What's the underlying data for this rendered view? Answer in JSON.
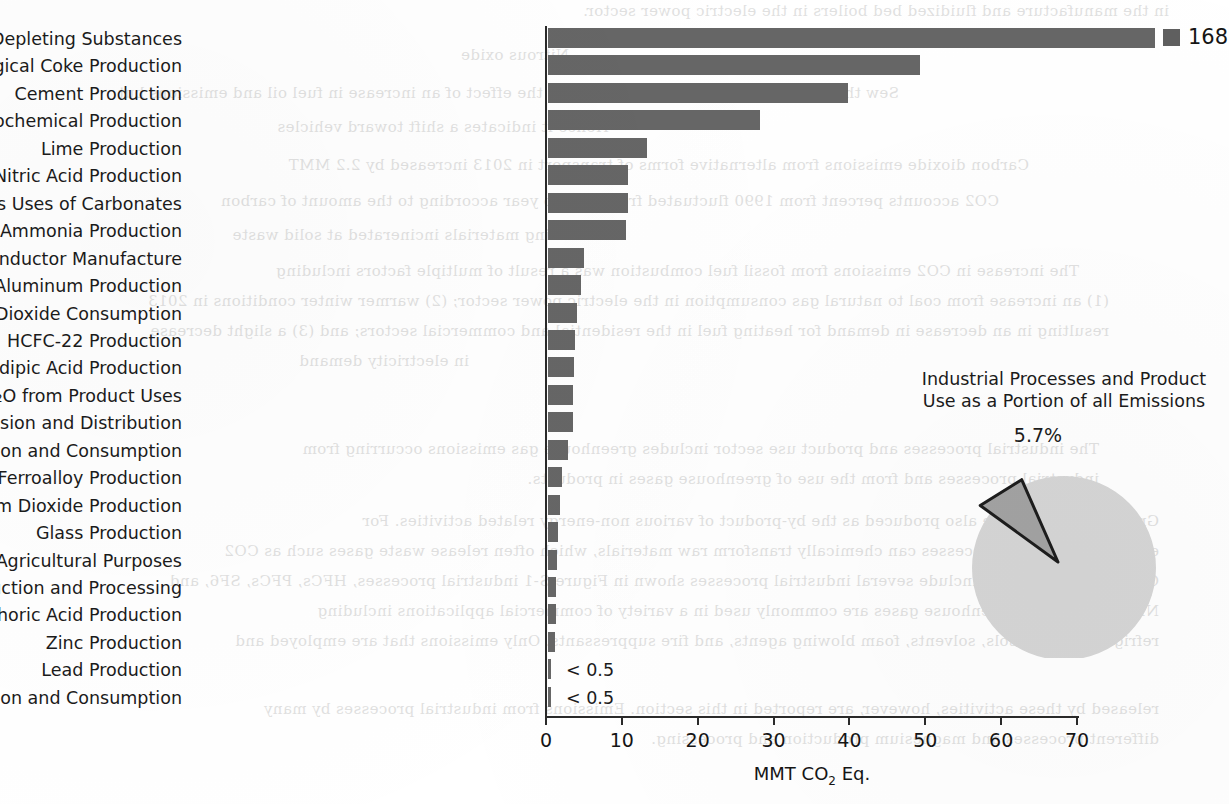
{
  "chart_data": {
    "type": "bar",
    "title": "",
    "xlabel": "MMT CO₂ Eq.",
    "ylabel": "",
    "xlim": [
      0,
      72
    ],
    "grid": false,
    "legend": "none",
    "orientation": "horizontal",
    "categories": [
      "Substitution of Ozone Depleting Substances",
      "Iron and Steel Production & Metallurgical Coke Production",
      "Cement Production",
      "Petrochemical Production",
      "Lime Production",
      "Nitric Acid Production",
      "Other Process Uses of Carbonates",
      "Ammonia Production",
      "Semiconductor Manufacture",
      "Aluminum Production",
      "Carbon Dioxide Consumption",
      "HCFC-22 Production",
      "Adipic Acid Production",
      "N₂O from Product Uses",
      "Electrical Transmission and Distribution",
      "Soda Ash Production and Consumption",
      "Ferroalloy Production",
      "Titanium Dioxide Production",
      "Glass Production",
      "Urea Consumption for Non-Agricultural Purposes",
      "Magnesium Production and Processing",
      "Phosphoric Acid Production",
      "Zinc Production",
      "Lead Production",
      "Silicon Carbide Production and Consumption"
    ],
    "values": [
      168,
      49.0,
      39.5,
      28.0,
      13.0,
      10.5,
      10.5,
      10.3,
      4.8,
      4.3,
      3.8,
      3.5,
      3.4,
      3.3,
      3.3,
      2.6,
      1.8,
      1.6,
      1.3,
      1.2,
      1.1,
      1.0,
      0.9,
      0.4,
      0.3
    ],
    "tick_values": [
      0,
      10,
      20,
      30,
      40,
      50,
      60,
      70
    ],
    "tick_labels": [
      "0",
      "10",
      "20",
      "30",
      "40",
      "50",
      "60",
      "70"
    ],
    "truncated_bar": {
      "category": "Substitution of Ozone Depleting Substances",
      "value": 168,
      "value_label": "168"
    },
    "bar_notes": [
      {
        "category": "Lead Production",
        "label": "< 0.5"
      },
      {
        "category": "Silicon Carbide Production and Consumption",
        "label": "< 0.5"
      }
    ],
    "bar_color": "#666666",
    "axis_color": "#2a2a2a"
  },
  "pie_chart": {
    "type": "pie",
    "title": "Industrial Processes and Product Use as a Portion of all Emissions",
    "title_line_1": "Industrial Processes and Product",
    "title_line_2": "Use as a Portion of all Emissions",
    "slices": [
      {
        "label": "Industrial Processes and Product Use",
        "value": 5.7,
        "value_label": "5.7%",
        "color": "#a3a3a3",
        "exploded": true
      },
      {
        "label": "All other emissions",
        "value": 94.3,
        "value_label": "",
        "color": "#d6d6d6",
        "exploded": false
      }
    ],
    "callout_label": "5.7%"
  },
  "background_bleed": {
    "note": "faint mirrored show-through text from reverse of scanned page",
    "lines": [
      "in the manufacture and fluidized bed boilers in the electric power sector.",
      "Nitrous oxide",
      "Sew through 2013 is primarily attributed to the effect of an increase in fuel oil and emissions but",
      "Hence it indicates a shift toward vehicles",
      "Carbon dioxide emissions from alternative forms of transport in 2013 increased by 2.2 MMT",
      "CO2 accounts percent from 1990 fluctuated from year to year according to the amount of carbon",
      "containing materials incinerated at solid waste",
      "The increase in CO2 emissions from fossil fuel combustion was a result of multiple factors including",
      "(1) an increase from coal to natural gas consumption in the electric power sector; (2) warmer winter conditions in 2013",
      "resulting in an decrease in demand for heating fuel in the residential and commercial sectors; and (3) a slight decrease",
      "in electricity demand",
      "The industrial processes and product use sector includes greenhouse gas emissions occurring from",
      "industrial processes and from the use of greenhouse gases in products.",
      "Greenhouse gases are also produced as the by-product of various non-energy related activities. For",
      "example, industrial processes can chemically transform raw materials, which often release waste gases such as CO2",
      "CH4. These processes include several industrial processes shown in Figure S-1 industrial processes, HFCs, PFCs, SF6, and",
      "NF3. In addition, greenhouse gases are commonly used in a variety of commercial applications including",
      "refrigerants, aerosols, solvents, foam blowing agents, and fire suppressants. Only emissions that are employed and",
      "released by these activities, however, are reported in this section. Emissions from industrial processes by many",
      "different processes and magnesium production and processing."
    ]
  }
}
